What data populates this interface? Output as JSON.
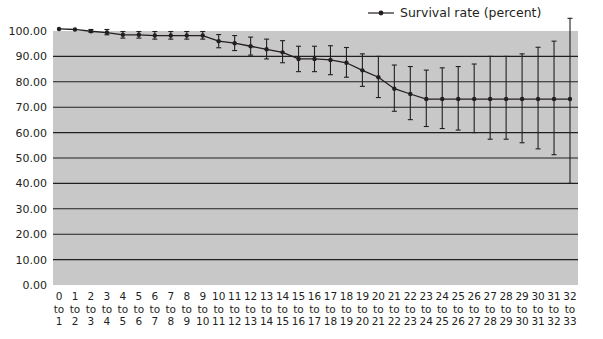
{
  "chart_data": {
    "type": "line",
    "title": "",
    "xlabel": "",
    "ylabel": "",
    "ylim": [
      0,
      100
    ],
    "yticks": [
      "0.00",
      "10.00",
      "20.00",
      "30.00",
      "40.00",
      "50.00",
      "60.00",
      "70.00",
      "80.00",
      "90.00",
      "100.00"
    ],
    "grid": true,
    "legend_position": "top-right",
    "categories": [
      "0 to 1",
      "1 to 2",
      "2 to 3",
      "3 to 4",
      "4 to 5",
      "5 to 6",
      "6 to 7",
      "7 to 8",
      "8 to 9",
      "9 to 10",
      "10 to 11",
      "11 to 12",
      "12 to 13",
      "13 to 14",
      "14 to 15",
      "15 to 16",
      "16 to 17",
      "17 to 18",
      "18 to 19",
      "19 to 20",
      "20 to 21",
      "21 to 22",
      "22 to 23",
      "23 to 24",
      "24 to 25",
      "25 to 26",
      "26 to 27",
      "27 to 28",
      "28 to 29",
      "29 to 30",
      "30 to 31",
      "31 to 32",
      "32 to 33"
    ],
    "series": [
      {
        "name": "Survival rate (percent)",
        "values": [
          100.8,
          100.6,
          99.9,
          99.4,
          98.5,
          98.5,
          98.2,
          98.2,
          98.2,
          98.2,
          96.0,
          95.2,
          94.0,
          92.8,
          91.6,
          89.0,
          89.0,
          88.6,
          87.5,
          84.5,
          81.8,
          77.3,
          75.2,
          73.2,
          73.2,
          73.2,
          73.2,
          73.2,
          73.2,
          73.2,
          73.2,
          73.2,
          73.2
        ],
        "error_upper": [
          100.8,
          100.6,
          100.6,
          100.6,
          99.8,
          99.8,
          99.8,
          99.8,
          99.8,
          99.8,
          98.6,
          98.2,
          97.6,
          96.8,
          96.2,
          94.0,
          94.0,
          94.2,
          93.5,
          91.0,
          90.0,
          86.6,
          86.0,
          84.6,
          85.5,
          86.0,
          87.0,
          90.0,
          90.0,
          91.0,
          93.6,
          96.0,
          105.0
        ],
        "error_lower": [
          100.8,
          100.6,
          99.5,
          98.5,
          97.2,
          97.2,
          96.8,
          96.8,
          96.8,
          96.8,
          93.4,
          92.3,
          90.5,
          89.0,
          87.5,
          84.0,
          84.0,
          82.8,
          81.8,
          78.2,
          73.8,
          68.4,
          65.1,
          62.4,
          61.6,
          61.0,
          60.0,
          57.4,
          57.4,
          56.0,
          53.6,
          51.3,
          40.0
        ]
      }
    ]
  },
  "legend": {
    "label": "Survival rate (percent)"
  },
  "colors": {
    "plot_bg": "#c8c8c8",
    "grid": "#231f20",
    "line": "#231f20",
    "text": "#231f20"
  }
}
